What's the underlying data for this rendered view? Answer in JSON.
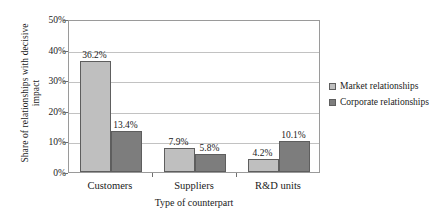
{
  "chart_data": {
    "type": "bar",
    "title": "",
    "xlabel": "Type of counterpart",
    "ylabel": "Share of relationships with decisive impact",
    "ylabel_lines": [
      "Share of relationships with decisive",
      "impact"
    ],
    "categories": [
      "Customers",
      "Suppliers",
      "R&D units"
    ],
    "series": [
      {
        "name": "Market relationships",
        "color": "#bfbfbf",
        "values": [
          36.2,
          7.9,
          4.2
        ],
        "labels": [
          "36.2%",
          "7.9%",
          "4.2%"
        ]
      },
      {
        "name": "Corporate relationships",
        "color": "#7d7d7d",
        "values": [
          13.4,
          5.8,
          10.1
        ],
        "labels": [
          "13.4%",
          "5.8%",
          "10.1%"
        ]
      }
    ],
    "ylim": [
      0,
      50
    ],
    "ytick_values": [
      0,
      10,
      20,
      30,
      40,
      50
    ],
    "ytick_labels": [
      "0%",
      "10%",
      "20%",
      "30%",
      "40%",
      "50%"
    ],
    "grid": true,
    "legend_position": "right",
    "value_suffix": "%"
  },
  "legend": {
    "items": [
      {
        "label": "Market relationships",
        "key": "market"
      },
      {
        "label": "Corporate relationships",
        "key": "corporate"
      }
    ]
  }
}
